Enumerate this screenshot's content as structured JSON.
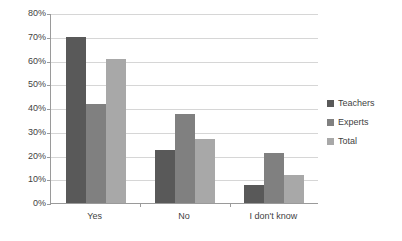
{
  "chart_data": {
    "type": "bar",
    "title": "",
    "subtitle": "",
    "xlabel": "",
    "ylabel": "",
    "categories": [
      "Yes",
      "No",
      "I don't know"
    ],
    "series": [
      {
        "name": "Teachers",
        "color": "#595959",
        "values": [
          70,
          22.5,
          7.5
        ]
      },
      {
        "name": "Experts",
        "color": "#808080",
        "values": [
          41.5,
          37.5,
          21
        ]
      },
      {
        "name": "Total",
        "color": "#a8a8a8",
        "values": [
          60.5,
          27,
          12
        ]
      }
    ],
    "ylim": [
      0,
      80
    ],
    "ytick_values": [
      0,
      10,
      20,
      30,
      40,
      50,
      60,
      70,
      80
    ],
    "ytick_labels": [
      "0%",
      "10%",
      "20%",
      "30%",
      "40%",
      "50%",
      "60%",
      "70%",
      "80%"
    ],
    "value_suffix": "%",
    "grid": "horizontal",
    "legend_position": "right",
    "bar_gap_within_group": 0,
    "plot_background": "#ffffff",
    "gridline_color": "#d6d6d6",
    "axis_color": "#9a9a9a"
  }
}
